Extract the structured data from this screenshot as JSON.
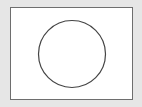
{
  "diagram": {
    "background_color": "#e6e6e6",
    "frame": {
      "fill": "#ffffff",
      "stroke": "#6e6e6e"
    },
    "shapes": [
      {
        "type": "circle",
        "cx": 72,
        "cy": 54,
        "r": 33.5,
        "stroke": "#444444",
        "fill": "none",
        "stroke_width": 1.2
      }
    ]
  }
}
